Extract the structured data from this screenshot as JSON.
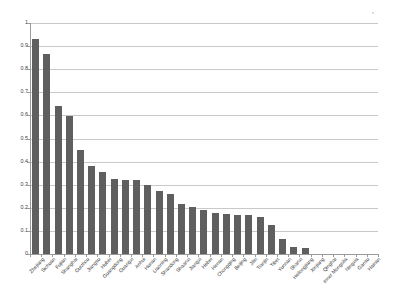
{
  "chart_data": {
    "type": "bar",
    "title": "",
    "subtitle": "",
    "xlabel": "",
    "ylabel": "",
    "ylim": [
      0,
      1
    ],
    "grid": true,
    "legend": false,
    "legend_position": "none",
    "bar_color": "#5f5f5f",
    "gridline_color": "#c9c9c9",
    "axis_color": "#9a9a9a",
    "ytick_labels": [
      "1",
      "0.9",
      "0.8",
      "0.7",
      "0.6",
      "0.5",
      "0.4",
      "0.3",
      "0.2",
      "0.1",
      "0"
    ],
    "ytick_values": [
      1,
      0.9,
      0.8,
      0.7,
      0.6,
      0.5,
      0.4,
      0.3,
      0.2,
      0.1,
      0
    ],
    "categories": [
      "Zhejiang",
      "Sichuan",
      "Fujian",
      "Shanghai",
      "Guizhou",
      "Jiangsu",
      "Hubei",
      "Guangdong",
      "Guangxi",
      "Anhui",
      "Hunan",
      "Liaoning",
      "Shandong",
      "Shaanxi",
      "Jiangxi",
      "Hebei",
      "Henan",
      "Chongqing",
      "Beijing",
      "Jilin",
      "Tianjin",
      "Tibet",
      "Yunnan",
      "Shanxi",
      "Heilongjiang",
      "Xinjiang",
      "Qinghai",
      "Inner Mongolia",
      "Ningxia",
      "Gansu",
      "Hainan"
    ],
    "values": [
      0.93,
      0.865,
      0.64,
      0.597,
      0.45,
      0.38,
      0.355,
      0.325,
      0.32,
      0.32,
      0.3,
      0.272,
      0.258,
      0.217,
      0.202,
      0.19,
      0.178,
      0.175,
      0.171,
      0.169,
      0.162,
      0.126,
      0.066,
      0.03,
      0.026,
      0.0,
      0.0,
      0.0,
      0.0,
      0.0,
      0.0
    ]
  }
}
